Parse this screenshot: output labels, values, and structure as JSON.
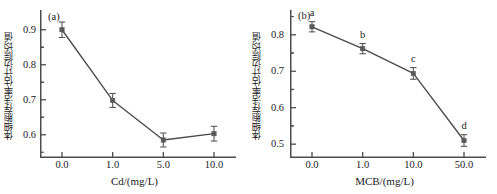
{
  "figure": {
    "width": 497,
    "height": 194,
    "background": "#ffffff",
    "axis_color": "#4d4d4d",
    "marker_color": "#595959",
    "line_color": "#4a4a4a",
    "text_color": "#1a1a1a"
  },
  "panels": [
    {
      "tag": "(a)",
      "ylabel": "体细胞存活率估计边际均值",
      "xlabel": "Cd/(mg/L)"
    },
    {
      "tag": "(b)",
      "ylabel": "体细胞存活率估计边际均值",
      "xlabel": "MCB/(mg/L)"
    }
  ],
  "chart_data": [
    {
      "type": "line",
      "title": "(a)",
      "xlabel": "Cd/(mg/L)",
      "ylabel": "体细胞存活率估计边际均值",
      "categories": [
        "0.0",
        "1.0",
        "5.0",
        "10.0"
      ],
      "x_tick_labels": [
        "0.0",
        "1.0",
        "5.0",
        "10.0"
      ],
      "y_tick_labels": [
        "0.9",
        "0.8",
        "0.7",
        "0.6"
      ],
      "y_ticks": [
        0.9,
        0.8,
        0.7,
        0.6
      ],
      "ylim": [
        0.545,
        0.945
      ],
      "grid": false,
      "legend": "none",
      "minor_ticks": true,
      "marker": "square",
      "series": [
        {
          "name": "体细胞存活率估计边际均值",
          "values": [
            0.9,
            0.698,
            0.585,
            0.603
          ],
          "errors": [
            0.022,
            0.02,
            0.02,
            0.021
          ]
        }
      ],
      "annotations": []
    },
    {
      "type": "line",
      "title": "(b)",
      "xlabel": "MCB/(mg/L)",
      "ylabel": "体细胞存活率估计边际均值",
      "categories": [
        "0.0",
        "1.0",
        "10.0",
        "50.0"
      ],
      "x_tick_labels": [
        "0.0",
        "1.0",
        "10.0",
        "50.0"
      ],
      "y_tick_labels": [
        "0.8",
        "0.7",
        "0.6",
        "0.5"
      ],
      "y_ticks": [
        0.8,
        0.7,
        0.6,
        0.5
      ],
      "ylim": [
        0.473,
        0.857
      ],
      "grid": false,
      "legend": "none",
      "minor_ticks": true,
      "marker": "square",
      "series": [
        {
          "name": "体细胞存活率估计边际均值",
          "values": [
            0.822,
            0.762,
            0.694,
            0.51
          ],
          "errors": [
            0.014,
            0.014,
            0.016,
            0.016
          ]
        }
      ],
      "annotations": [
        "a",
        "b",
        "c",
        "d"
      ]
    }
  ]
}
